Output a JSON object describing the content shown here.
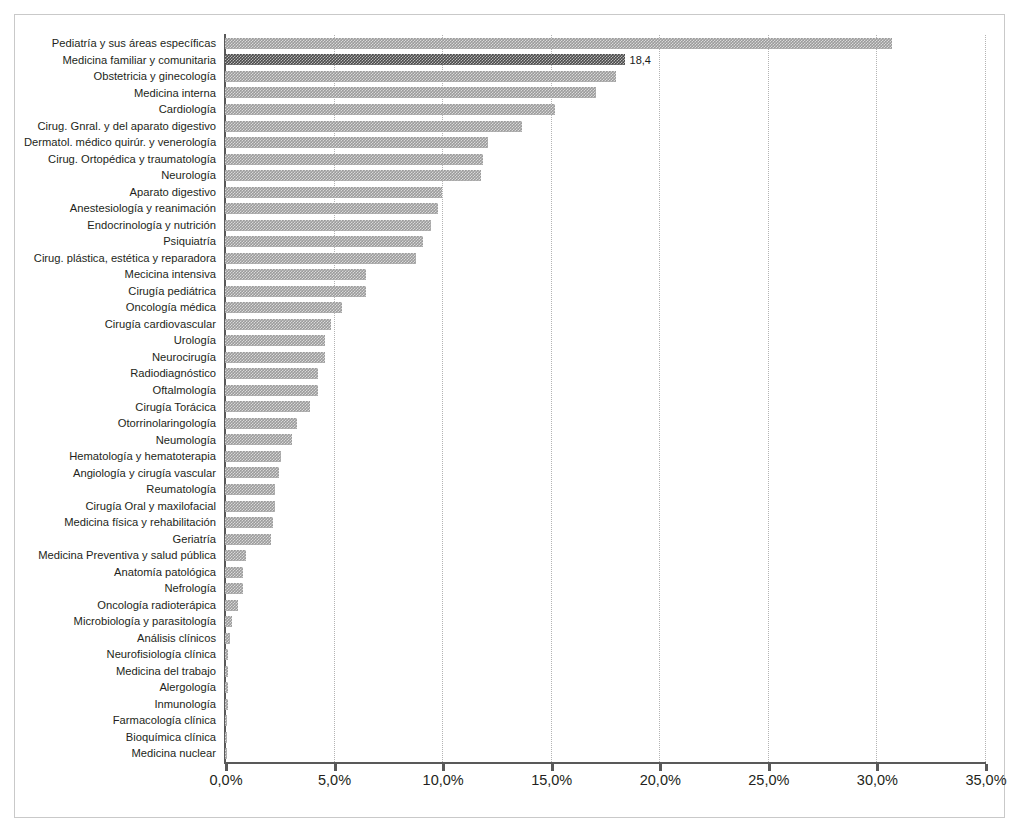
{
  "chart_data": {
    "type": "bar",
    "orientation": "horizontal",
    "title": "",
    "xlabel": "",
    "ylabel": "",
    "xlim": [
      0,
      35
    ],
    "xticks": [
      "0,0%",
      "5,0%",
      "10,0%",
      "15,0%",
      "20,0%",
      "25,0%",
      "30,0%",
      "35,0%"
    ],
    "xtick_values": [
      0,
      5,
      10,
      15,
      20,
      25,
      30,
      35
    ],
    "grid": "vertical-dotted",
    "legend": "none",
    "bar_color": "#9b9b9b",
    "highlight_color": "#4a4a4a",
    "highlight_category": "Medicina familiar y comunitaria",
    "categories": [
      "Pediatría y sus áreas específicas",
      "Medicina familiar y comunitaria",
      "Obstetricia y ginecología",
      "Medicina interna",
      "Cardiología",
      "Cirug. Gnral. y del aparato digestivo",
      "Dermatol. médico quirúr. y venerología",
      "Cirug. Ortopédica y traumatología",
      "Neurología",
      "Aparato digestivo",
      "Anestesiología y reanimación",
      "Endocrinología y nutrición",
      "Psiquiatría",
      "Cirug. plástica, estética y reparadora",
      "Mecicina intensiva",
      "Cirugía pediátrica",
      "Oncología médica",
      "Cirugía cardiovascular",
      "Urología",
      "Neurocirugía",
      "Radiodiagnóstico",
      "Oftalmología",
      "Cirugía Torácica",
      "Otorrinolaringología",
      "Neumología",
      "Hematología y hematoterapia",
      "Angiología y cirugía vascular",
      "Reumatología",
      "Cirugía Oral y maxilofacial",
      "Medicina física y rehabilitación",
      "Geriatría",
      "Medicina Preventiva y salud pública",
      "Anatomía patológica",
      "Nefrología",
      "Oncología radioterápica",
      "Microbiología y parasitología",
      "Análisis clínicos",
      "Neurofisiología clínica",
      "Medicina del trabajo",
      "Alergología",
      "Inmunología",
      "Farmacología clínica",
      "Bioquímica clínica",
      "Medicina nuclear"
    ],
    "values": [
      30.7,
      18.4,
      18.0,
      17.1,
      15.2,
      13.7,
      12.1,
      11.9,
      11.8,
      10.0,
      9.8,
      9.5,
      9.1,
      8.8,
      6.5,
      6.5,
      5.4,
      4.9,
      4.6,
      4.6,
      4.3,
      4.3,
      3.9,
      3.3,
      3.1,
      2.6,
      2.5,
      2.3,
      2.3,
      2.2,
      2.1,
      0.95,
      0.85,
      0.82,
      0.62,
      0.32,
      0.22,
      0.16,
      0.14,
      0.12,
      0.12,
      0.1,
      0.1,
      0.08
    ],
    "data_labels": {
      "1": "18,4"
    }
  }
}
